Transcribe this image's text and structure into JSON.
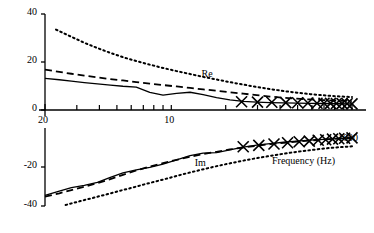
{
  "chart_data": {
    "type": "line",
    "title": "",
    "xlabel": "Frequency (Hz)",
    "ylabel": "Normalised impedance",
    "xscale": "log",
    "xlim": [
      20,
      1000
    ],
    "ylim": [
      -40,
      40
    ],
    "ytick_labels": [
      "40",
      "20",
      "0",
      "-20",
      "-40"
    ],
    "ytick_values": [
      40,
      20,
      0,
      -20,
      -40
    ],
    "xtick_labels": [
      "20",
      "10",
      "1000"
    ],
    "xtick_label_values": [
      20,
      100,
      1000
    ],
    "xtick_minor_values": [
      30,
      40,
      50,
      60,
      70,
      80,
      90,
      100,
      200,
      300,
      400,
      500,
      600,
      700,
      800,
      900,
      1000
    ],
    "grid": false,
    "legend_position": "inline-annotations",
    "annotations": [
      {
        "text": "Re",
        "x": 120,
        "y": 11
      },
      {
        "text": "Im",
        "x": 110,
        "y": -13
      }
    ],
    "series": [
      {
        "name": "Re solid",
        "part": "Re",
        "style": "solid",
        "x": [
          20,
          24,
          28,
          33,
          39,
          46,
          54,
          64,
          76,
          90,
          107,
          127,
          150,
          178,
          211,
          250,
          297,
          352,
          418,
          496,
          588,
          698,
          828,
          1000
        ],
        "y": [
          13.2,
          12.6,
          12.0,
          11.4,
          10.9,
          10.4,
          9.9,
          9.5,
          7.3,
          6.2,
          6.9,
          7.4,
          6.4,
          5.2,
          4.2,
          3.6,
          3.3,
          3.1,
          3.0,
          2.9,
          2.8,
          2.7,
          2.6,
          2.5
        ]
      },
      {
        "name": "Re dashed",
        "part": "Re",
        "style": "dashed",
        "x": [
          20,
          24,
          28,
          33,
          39,
          46,
          54,
          64,
          76,
          90,
          107,
          127,
          150,
          178,
          211,
          250,
          297,
          352,
          418,
          496,
          588,
          698,
          828,
          1000
        ],
        "y": [
          16.8,
          15.9,
          15.1,
          14.3,
          13.6,
          12.9,
          12.3,
          11.6,
          11.0,
          10.4,
          9.8,
          9.2,
          8.6,
          8.0,
          7.4,
          6.8,
          6.2,
          5.6,
          5.1,
          4.7,
          4.4,
          4.1,
          3.9,
          3.7
        ]
      },
      {
        "name": "Re dotted",
        "part": "Re",
        "style": "dotted",
        "x": [
          23,
          28,
          33,
          39,
          46,
          54,
          64,
          76,
          90,
          107,
          127,
          150,
          178,
          211,
          250,
          297,
          352,
          418,
          496,
          588,
          698,
          828,
          1000
        ],
        "y": [
          33.5,
          30.5,
          28.0,
          25.8,
          23.8,
          22.0,
          20.4,
          18.9,
          17.5,
          16.2,
          15.0,
          13.8,
          12.7,
          11.6,
          10.6,
          9.6,
          8.7,
          7.9,
          7.2,
          6.6,
          6.1,
          5.7,
          5.4
        ]
      },
      {
        "name": "Im solid",
        "part": "Im",
        "style": "solid",
        "x": [
          20,
          24,
          28,
          33,
          39,
          46,
          54,
          64,
          76,
          90,
          107,
          127,
          150,
          178,
          211,
          250,
          297,
          352,
          418,
          496,
          588,
          698,
          828,
          1000
        ],
        "y": [
          -34.5,
          -32.4,
          -30.6,
          -29.4,
          -27.9,
          -25.3,
          -23.0,
          -21.5,
          -20.2,
          -18.5,
          -16.4,
          -14.2,
          -12.9,
          -12.6,
          -11.2,
          -9.8,
          -8.8,
          -8.0,
          -7.3,
          -6.7,
          -6.2,
          -5.8,
          -5.4,
          -5.1
        ]
      },
      {
        "name": "Im dashed",
        "part": "Im",
        "style": "dashed",
        "x": [
          20,
          24,
          28,
          33,
          39,
          46,
          54,
          64,
          76,
          90,
          107,
          127,
          150,
          178,
          211,
          250,
          297,
          352,
          418,
          496,
          588,
          698,
          828,
          1000
        ],
        "y": [
          -35.2,
          -33.5,
          -31.8,
          -30.1,
          -28.3,
          -26.2,
          -24.0,
          -21.8,
          -19.8,
          -18.0,
          -16.3,
          -14.8,
          -13.4,
          -12.2,
          -11.0,
          -10.0,
          -9.1,
          -8.3,
          -7.6,
          -7.0,
          -6.4,
          -5.9,
          -5.5,
          -5.1
        ]
      },
      {
        "name": "Im dotted",
        "part": "Im",
        "style": "dotted",
        "x": [
          26,
          31,
          37,
          44,
          52,
          62,
          73,
          87,
          103,
          122,
          145,
          172,
          204,
          242,
          287,
          341,
          405,
          480,
          570,
          676,
          802,
          1000
        ],
        "y": [
          -39.5,
          -37.6,
          -35.8,
          -34.0,
          -32.2,
          -30.4,
          -28.6,
          -26.8,
          -25.0,
          -23.2,
          -21.5,
          -19.9,
          -18.4,
          -17.0,
          -15.7,
          -14.5,
          -13.4,
          -12.4,
          -11.5,
          -10.7,
          -10.0,
          -9.4
        ]
      }
    ],
    "markers": {
      "symbol": "x",
      "re_x": [
        245,
        300,
        360,
        430,
        500,
        570,
        640,
        700,
        760,
        820,
        880,
        940,
        1000
      ],
      "re_y": [
        3.4,
        3.3,
        3.2,
        3.1,
        3.0,
        2.9,
        2.85,
        2.8,
        2.75,
        2.7,
        2.65,
        2.6,
        2.55
      ],
      "im_x": [
        250,
        305,
        370,
        440,
        510,
        580,
        650,
        715,
        780,
        845,
        910,
        1000
      ],
      "im_y": [
        -9.6,
        -8.9,
        -8.2,
        -7.6,
        -7.1,
        -6.7,
        -6.3,
        -6.0,
        -5.7,
        -5.5,
        -5.3,
        -5.1
      ]
    }
  },
  "labels": {
    "ylabel": "Normalised impedance",
    "xlabel": "Frequency (Hz)",
    "re": "Re",
    "im": "Im",
    "y40": "40",
    "y20": "20",
    "y0": "0",
    "ym20": "-20",
    "ym40": "-40",
    "x20": "20",
    "x10": "10",
    "x1000": "1000"
  },
  "colors": {
    "ink": "#000000",
    "background": "#ffffff"
  }
}
